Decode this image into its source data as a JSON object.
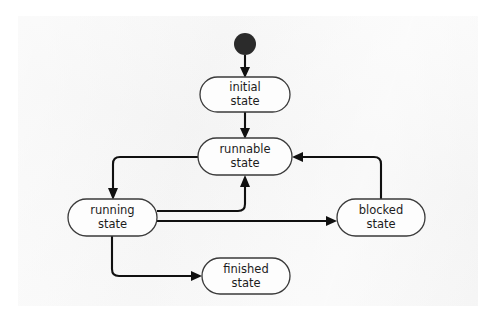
{
  "diagram": {
    "type": "uml-state-machine",
    "background_color": "#f4f4f4",
    "page_color": "#ffffff",
    "node_fill": "#fdfdfd",
    "node_stroke": "#3a3a3a",
    "edge_color": "#101010",
    "initial_marker": {
      "name": "initial-pseudostate",
      "shape": "filled-circle",
      "color": "#2b2b2b",
      "cx": 245,
      "cy": 44,
      "r": 11
    },
    "states": [
      {
        "id": "initial",
        "line1": "initial",
        "line2": "state",
        "x": 200,
        "y": 77,
        "w": 90,
        "h": 35
      },
      {
        "id": "runnable",
        "line1": "runnable",
        "line2": "state",
        "x": 198,
        "y": 138,
        "w": 94,
        "h": 37
      },
      {
        "id": "running",
        "line1": "running",
        "line2": "state",
        "x": 68,
        "y": 199,
        "w": 89,
        "h": 37
      },
      {
        "id": "blocked",
        "line1": "blocked",
        "line2": "state",
        "x": 337,
        "y": 199,
        "w": 88,
        "h": 37
      },
      {
        "id": "finished",
        "line1": "finished",
        "line2": "state",
        "x": 202,
        "y": 258,
        "w": 88,
        "h": 36
      }
    ],
    "transitions": [
      {
        "id": "start-to-initial",
        "from": "initial-pseudostate",
        "to": "initial",
        "label": ""
      },
      {
        "id": "initial-to-runnable",
        "from": "initial",
        "to": "runnable",
        "label": ""
      },
      {
        "id": "runnable-to-running",
        "from": "runnable",
        "to": "running",
        "label": ""
      },
      {
        "id": "running-to-runnable",
        "from": "running",
        "to": "runnable",
        "label": ""
      },
      {
        "id": "running-to-blocked",
        "from": "running",
        "to": "blocked",
        "label": ""
      },
      {
        "id": "blocked-to-runnable",
        "from": "blocked",
        "to": "runnable",
        "label": ""
      },
      {
        "id": "running-to-finished",
        "from": "running",
        "to": "finished",
        "label": ""
      }
    ]
  }
}
